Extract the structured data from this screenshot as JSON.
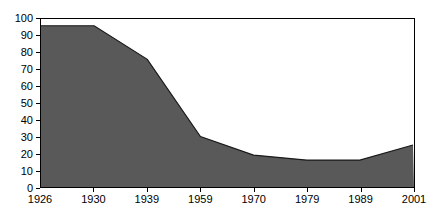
{
  "chart_data": {
    "type": "area",
    "title": "",
    "subtitle": "",
    "xlabel": "",
    "ylabel": "",
    "categories": [
      "1926",
      "1930",
      "1939",
      "1959",
      "1970",
      "1979",
      "1989",
      "2001"
    ],
    "values": [
      96,
      96,
      76,
      30,
      19,
      16,
      16,
      25
    ],
    "series": [
      {
        "name": "",
        "values": [
          96,
          96,
          76,
          30,
          19,
          16,
          16,
          25
        ]
      }
    ],
    "ylim": [
      0,
      100
    ],
    "y_ticks": [
      0,
      10,
      20,
      30,
      40,
      50,
      60,
      70,
      80,
      90,
      100
    ],
    "y_tick_labels": [
      "0",
      "10",
      "20",
      "30",
      "40",
      "50",
      "60",
      "70",
      "80",
      "90",
      "100"
    ],
    "x_tick_labels": [
      "1926",
      "1930",
      "1939",
      "1959",
      "1970",
      "1979",
      "1989",
      "2001"
    ],
    "grid": false,
    "legend": false,
    "legend_position": "none",
    "annotations": [],
    "colors": {
      "area_fill": "#595959",
      "area_line": "#1a1a1a",
      "axis": "#000000",
      "plot_background": "#ffffff",
      "page_background": "#ffffff",
      "tick_label": "#000000"
    }
  }
}
